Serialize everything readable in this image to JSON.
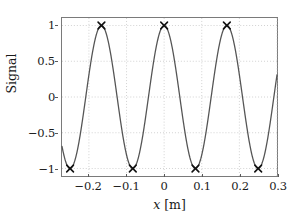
{
  "chart_data": {
    "type": "line",
    "title": "",
    "xlabel": "x  [m]",
    "xlabel_symbol": "x",
    "xlabel_unit": "[m]",
    "ylabel": "Signal",
    "xlim": [
      -0.2715,
      0.3
    ],
    "ylim": [
      -1.105,
      1.105
    ],
    "xticks": [
      -0.2,
      -0.1,
      0,
      0.1,
      0.2,
      0.3
    ],
    "xticklabels": [
      "-0.2",
      "-0.1",
      "0",
      "0.1",
      "0.2",
      "0.3"
    ],
    "yticks": [
      1,
      0.5,
      0,
      -0.5,
      -1
    ],
    "yticklabels": [
      "1",
      "0.5",
      "0",
      "-0.5",
      "-1"
    ],
    "grid": true,
    "grid_style": "dotted",
    "grid_color": "#bfbfbf",
    "legend": "none",
    "series": [
      {
        "name": "signal",
        "type": "line",
        "color": "#555555",
        "linewidth": 1.3,
        "description": "cosine wave, amplitude 1, wavelength 0.1667 m, peak at x = 0",
        "amplitude": 1,
        "wavelength": 0.16667,
        "phase_deg": 0,
        "x_start": -0.2715,
        "x_end": 0.3
      },
      {
        "name": "extrema-markers",
        "type": "scatter",
        "marker": "x",
        "color": "#111111",
        "points": [
          {
            "x": -0.25,
            "y": -1
          },
          {
            "x": -0.1667,
            "y": 1
          },
          {
            "x": -0.0833,
            "y": -1
          },
          {
            "x": 0,
            "y": 1
          },
          {
            "x": 0.0833,
            "y": -1
          },
          {
            "x": 0.1667,
            "y": 1
          },
          {
            "x": 0.25,
            "y": -1
          }
        ]
      }
    ]
  }
}
